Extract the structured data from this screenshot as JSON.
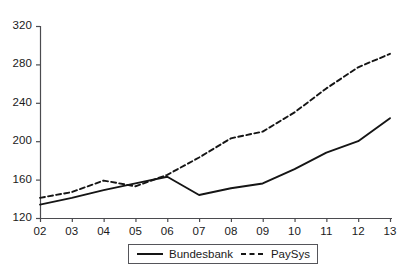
{
  "chart_data": {
    "type": "line",
    "title": "",
    "subtitle": "",
    "xlabel": "",
    "ylabel": "",
    "categories": [
      "02",
      "03",
      "04",
      "05",
      "06",
      "07",
      "08",
      "09",
      "10",
      "11",
      "12",
      "13"
    ],
    "x_tick_labels": [
      "02",
      "03",
      "04",
      "05",
      "06",
      "07",
      "08",
      "09",
      "10",
      "11",
      "12",
      "13"
    ],
    "y_tick_labels": [
      "120",
      "160",
      "200",
      "240",
      "280",
      "320"
    ],
    "y_ticks": [
      120,
      160,
      200,
      240,
      280,
      320
    ],
    "ylim": [
      120,
      320
    ],
    "xlim": [
      "02",
      "13"
    ],
    "grid": false,
    "legend_position": "bottom-center",
    "series": [
      {
        "name": "Bundesbank",
        "style": "solid",
        "color": "#151515",
        "values": [
          134,
          141,
          149,
          156,
          163,
          144,
          151,
          156,
          171,
          188,
          200,
          224
        ]
      },
      {
        "name": "PaySys",
        "style": "dashed",
        "color": "#151515",
        "values": [
          141,
          147,
          159,
          153,
          165,
          183,
          203,
          210,
          230,
          255,
          277,
          291
        ]
      }
    ],
    "annotations": []
  },
  "legend": {
    "items": [
      {
        "label": "Bundesbank",
        "style": "solid"
      },
      {
        "label": "PaySys",
        "style": "dashed"
      }
    ]
  },
  "axes": {
    "y_axis_name": "y-axis",
    "x_axis_name": "x-axis"
  }
}
